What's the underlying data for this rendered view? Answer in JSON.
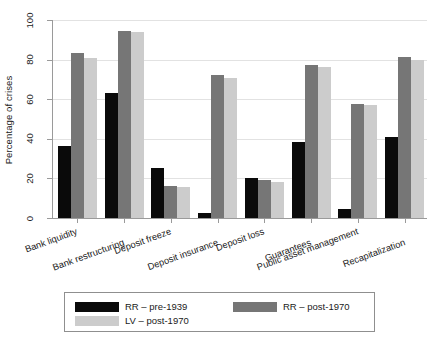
{
  "chart_data": {
    "type": "bar",
    "title": "",
    "xlabel": "",
    "ylabel": "Percentage of crises",
    "ylim": [
      0,
      100
    ],
    "yticks": [
      0,
      20,
      40,
      60,
      80,
      100
    ],
    "grid": true,
    "legend_position": "bottom",
    "categories": [
      "Bank liquidity",
      "Bank restructuring",
      "Deposit freeze",
      "Deposit insurance",
      "Deposit loss",
      "Guarantees",
      "Public asset management",
      "Recapitalization"
    ],
    "series": [
      {
        "name": "RR – pre-1939",
        "color": "#0a0a0a",
        "values": [
          36.5,
          63,
          25.5,
          2.5,
          20,
          38.5,
          4.5,
          41
        ]
      },
      {
        "name": "RR – post-1970",
        "color": "#767676",
        "values": [
          83.5,
          94.5,
          16,
          72,
          19,
          77.5,
          57.5,
          81.5
        ]
      },
      {
        "name": "LV – post-1970",
        "color": "#cccccc",
        "values": [
          81,
          94,
          15.5,
          70.5,
          18,
          76.5,
          57,
          80
        ]
      }
    ]
  }
}
